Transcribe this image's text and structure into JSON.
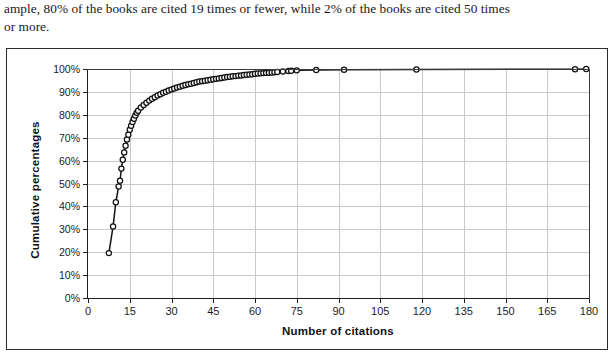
{
  "page_text": {
    "lines": [
      "ample, 80% of the books are cited 19 times or fewer, while 2% of the books are cited 50 times",
      "or more."
    ]
  },
  "chart_data": {
    "type": "line",
    "title": "",
    "subtitle": "",
    "xlabel": "Number of citations",
    "ylabel": "Cumulative percentages",
    "xlim": [
      0,
      180
    ],
    "ylim": [
      0,
      1
    ],
    "xticks": [
      0,
      15,
      30,
      45,
      60,
      75,
      90,
      105,
      120,
      135,
      150,
      165,
      180
    ],
    "xtick_labels": [
      "0",
      "15",
      "30",
      "45",
      "60",
      "75",
      "90",
      "105",
      "120",
      "135",
      "150",
      "165",
      "180"
    ],
    "yticks": [
      0,
      0.1,
      0.2,
      0.3,
      0.4,
      0.5,
      0.6,
      0.7,
      0.8,
      0.9,
      1.0
    ],
    "ytick_labels": [
      "0%",
      "10%",
      "20%",
      "30%",
      "40%",
      "50%",
      "60%",
      "70%",
      "80%",
      "90%",
      "100%"
    ],
    "grid": true,
    "grid_axis": "both",
    "legend": false,
    "legend_position": "none",
    "marker": "open-circle",
    "marker_size": 5.2,
    "line_color": "#111113",
    "marker_edge_color": "#111113",
    "marker_face_color": "#ffffff",
    "series": [
      {
        "name": "Cumulative percentage of books",
        "x": [
          7.5,
          9,
          10,
          11,
          11.5,
          12,
          12.5,
          13,
          13.5,
          14,
          14.5,
          15,
          15.5,
          16,
          16.5,
          17,
          17.5,
          18,
          19,
          20,
          21,
          22,
          23,
          24,
          25,
          26,
          27,
          28,
          29,
          30,
          31,
          32,
          33,
          34,
          35,
          36,
          37,
          38,
          39,
          40,
          41,
          42,
          43,
          44,
          45,
          46,
          47,
          48,
          49,
          50,
          51,
          52,
          53,
          54,
          55,
          56,
          57,
          58,
          59,
          60,
          61,
          62,
          63,
          64,
          65,
          66,
          67,
          68,
          70,
          72,
          73,
          75,
          82,
          92,
          118,
          175,
          179
        ],
        "y": [
          0.196,
          0.312,
          0.418,
          0.487,
          0.512,
          0.565,
          0.604,
          0.635,
          0.665,
          0.692,
          0.713,
          0.735,
          0.752,
          0.769,
          0.783,
          0.797,
          0.809,
          0.818,
          0.832,
          0.843,
          0.853,
          0.862,
          0.87,
          0.877,
          0.884,
          0.89,
          0.896,
          0.901,
          0.906,
          0.911,
          0.915,
          0.919,
          0.923,
          0.927,
          0.93,
          0.933,
          0.936,
          0.939,
          0.942,
          0.945,
          0.947,
          0.949,
          0.951,
          0.953,
          0.955,
          0.957,
          0.959,
          0.961,
          0.963,
          0.965,
          0.966,
          0.968,
          0.969,
          0.971,
          0.972,
          0.974,
          0.975,
          0.976,
          0.977,
          0.979,
          0.98,
          0.981,
          0.982,
          0.983,
          0.984,
          0.985,
          0.986,
          0.987,
          0.989,
          0.991,
          0.992,
          0.994,
          0.996,
          0.997,
          0.998,
          0.999,
          1.0
        ]
      }
    ],
    "annotations": []
  }
}
